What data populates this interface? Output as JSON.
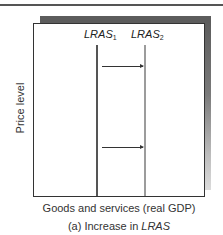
{
  "diagram": {
    "caption_prefix": "(a) Increase in ",
    "caption_italic": "LRAS",
    "x_axis_label": "Goods and services (real GDP)",
    "y_axis_label": "Price level",
    "curves": [
      {
        "name": "LRAS",
        "subscript": "1",
        "color": "#555555"
      },
      {
        "name": "LRAS",
        "subscript": "2",
        "color": "#9c9c9c"
      }
    ],
    "arrows": [
      {
        "direction": "right",
        "from": "LRAS1",
        "to": "LRAS2",
        "position": "upper"
      },
      {
        "direction": "right",
        "from": "LRAS1",
        "to": "LRAS2",
        "position": "lower"
      }
    ]
  }
}
